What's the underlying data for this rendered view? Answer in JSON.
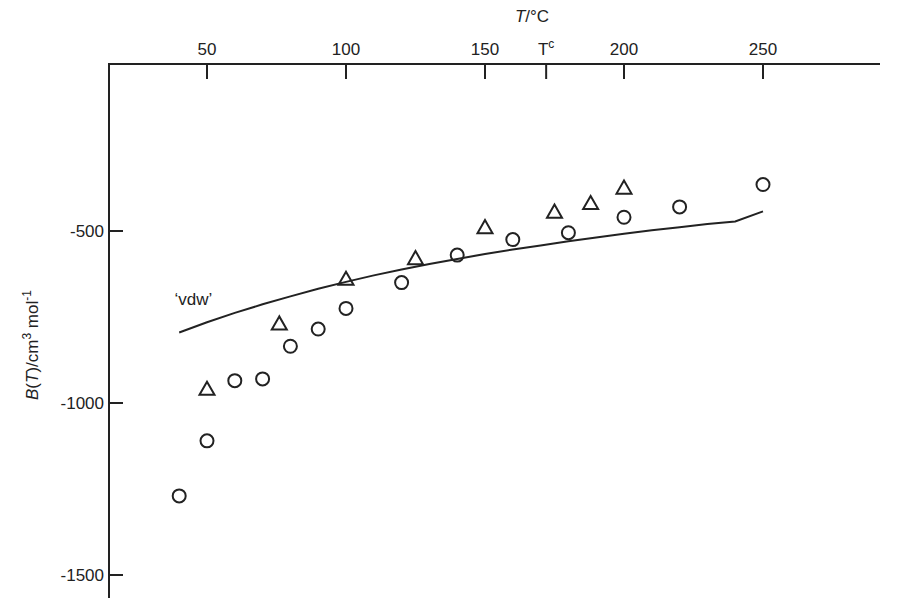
{
  "chart_data": {
    "type": "scatter",
    "title": "",
    "xlabel": "T/°C",
    "ylabel": "B(T)/cm³ mol⁻¹",
    "xlabel_parts": {
      "italic": "T",
      "rest": "/°C"
    },
    "ylabel_parts": {
      "italic_B": "B(",
      "italic_T": "T",
      "rest": ")/cm",
      "sup3": "3",
      "mol": " mol",
      "supm1": "-1"
    },
    "x_axis_position": "top",
    "xlim": [
      30,
      252
    ],
    "ylim": [
      -1560,
      0
    ],
    "x_ticks": [
      50,
      100,
      150,
      200,
      250
    ],
    "x_tick_labels": [
      "50",
      "100",
      "150",
      "200",
      "250"
    ],
    "extra_x_tick": {
      "x": 172,
      "label": "T",
      "sup": "c"
    },
    "y_ticks": [
      -500,
      -1000,
      -1500
    ],
    "y_tick_labels": [
      "-500",
      "-1000",
      "-1500"
    ],
    "grid": false,
    "legend": null,
    "annotations": [
      {
        "text": "‘vdw’",
        "x": 39,
        "y": -705
      }
    ],
    "series": [
      {
        "name": "circles",
        "marker": "circle",
        "x": [
          40,
          50,
          60,
          70,
          80,
          90,
          100,
          120,
          140,
          160,
          180,
          200,
          220,
          250
        ],
        "y": [
          -1270,
          -1110,
          -935,
          -930,
          -835,
          -785,
          -725,
          -650,
          -570,
          -525,
          -505,
          -460,
          -430,
          -365
        ]
      },
      {
        "name": "triangles",
        "marker": "triangle",
        "x": [
          50,
          76,
          100,
          125,
          150,
          175,
          188,
          200
        ],
        "y": [
          -960,
          -770,
          -640,
          -580,
          -490,
          -445,
          -420,
          -375
        ]
      },
      {
        "name": "vdw",
        "marker": "line",
        "x": [
          40,
          50,
          60,
          70,
          80,
          90,
          100,
          110,
          120,
          130,
          140,
          150,
          160,
          170,
          180,
          190,
          200,
          210,
          220,
          230,
          240,
          250
        ],
        "y": [
          -795,
          -765,
          -738,
          -713,
          -690,
          -668,
          -648,
          -629,
          -612,
          -596,
          -581,
          -567,
          -554,
          -542,
          -530,
          -519,
          -508,
          -498,
          -489,
          -480,
          -472,
          -443
        ]
      }
    ]
  }
}
